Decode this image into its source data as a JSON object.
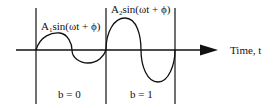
{
  "diagram": {
    "axis": {
      "label": "Time, t"
    },
    "segments": [
      {
        "bit_label": "b = 0",
        "expr_prefix": "A",
        "expr_sub": "1",
        "expr_suffix": "sin(ωt + ϕ)"
      },
      {
        "bit_label": "b = 1",
        "expr_prefix": "A",
        "expr_sub": "2",
        "expr_suffix": "sin(ωt + ϕ)"
      }
    ],
    "colors": {
      "stroke": "#111111",
      "background": "#ffffff"
    }
  }
}
